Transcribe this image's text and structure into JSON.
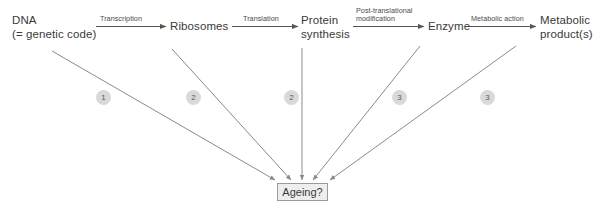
{
  "diagram": {
    "nodes": [
      {
        "id": "dna",
        "lines": [
          "DNA",
          "(= genetic code)"
        ]
      },
      {
        "id": "ribosomes",
        "lines": [
          "Ribosomes"
        ]
      },
      {
        "id": "protein",
        "lines": [
          "Protein",
          "synthesis"
        ]
      },
      {
        "id": "enzyme",
        "lines": [
          "Enzyme"
        ]
      },
      {
        "id": "metabolic",
        "lines": [
          "Metabolic",
          "product(s)"
        ]
      }
    ],
    "edge_labels": [
      {
        "id": "transcription",
        "lines": [
          "Transcription"
        ]
      },
      {
        "id": "translation",
        "lines": [
          "Translation"
        ]
      },
      {
        "id": "post-translational",
        "lines": [
          "Post-translational",
          "modification"
        ]
      },
      {
        "id": "metabolic-action",
        "lines": [
          "Metabolic action"
        ]
      }
    ],
    "badges": [
      {
        "id": "badge-1",
        "label": "1"
      },
      {
        "id": "badge-2a",
        "label": "2"
      },
      {
        "id": "badge-2b",
        "label": "2"
      },
      {
        "id": "badge-3a",
        "label": "3"
      },
      {
        "id": "badge-3b",
        "label": "3"
      }
    ],
    "outcome": {
      "label": "Ageing?"
    },
    "colors": {
      "text": "#3a3a3a",
      "line": "#8c8c8c",
      "badge_fill": "#d9d9d9",
      "badge_text": "#5a5a5a",
      "box_fill": "#eeeeee",
      "box_border": "#9a9a9a",
      "background": "#ffffff"
    }
  }
}
